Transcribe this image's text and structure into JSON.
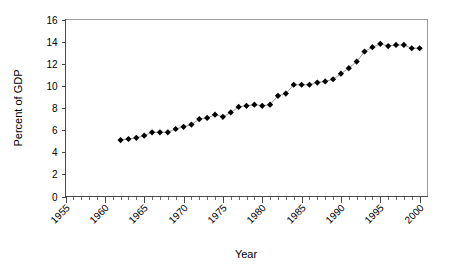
{
  "chart_data": {
    "type": "line",
    "title": "",
    "xlabel": "Year",
    "ylabel": "Percent of GDP",
    "xlim": [
      1955,
      2001
    ],
    "ylim": [
      0,
      16
    ],
    "ytick_step": 2,
    "xtick_step": 5,
    "x_minor_tick_step": 1,
    "grid": false,
    "legend": "none",
    "marker": "filled-diamond",
    "marker_color": "#000000",
    "line_color": "#8f8f8f",
    "x_tick_labels": [
      "1955",
      "1960",
      "1965",
      "1970",
      "1975",
      "1980",
      "1985",
      "1990",
      "1995",
      "2000"
    ],
    "y_tick_labels": [
      "0",
      "2",
      "4",
      "6",
      "8",
      "10",
      "12",
      "14",
      "16"
    ],
    "x_tick_label_rotation_deg": -45,
    "series": [
      {
        "name": "Percent of GDP",
        "x": [
          1962,
          1963,
          1964,
          1965,
          1966,
          1967,
          1968,
          1969,
          1970,
          1971,
          1972,
          1973,
          1974,
          1975,
          1976,
          1977,
          1978,
          1979,
          1980,
          1981,
          1982,
          1983,
          1984,
          1985,
          1986,
          1987,
          1988,
          1989,
          1990,
          1991,
          1992,
          1993,
          1994,
          1995,
          1996,
          1997,
          1998,
          1999,
          2000
        ],
        "values": [
          5.1,
          5.2,
          5.3,
          5.5,
          5.8,
          5.8,
          5.8,
          6.1,
          6.3,
          6.5,
          7.0,
          7.1,
          7.4,
          7.2,
          7.6,
          8.1,
          8.2,
          8.3,
          8.2,
          8.3,
          9.1,
          9.3,
          10.1,
          10.1,
          10.1,
          10.3,
          10.4,
          10.6,
          11.1,
          11.6,
          12.2,
          13.1,
          13.5,
          13.8,
          13.6,
          13.7,
          13.7,
          13.4,
          13.4
        ]
      }
    ]
  }
}
